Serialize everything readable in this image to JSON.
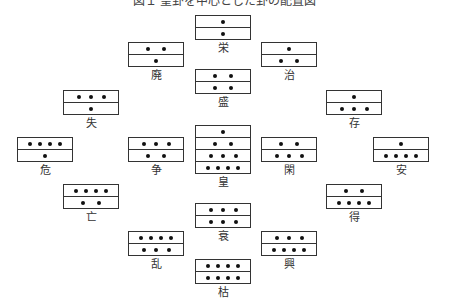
{
  "title": "図１ 皇卦を中心とした卦の配置図",
  "nodes": [
    {
      "label": "栄",
      "x": 195,
      "y": 15,
      "rows": [
        1,
        1
      ]
    },
    {
      "label": "廃",
      "x": 128,
      "y": 42,
      "rows": [
        2,
        1
      ]
    },
    {
      "label": "治",
      "x": 261,
      "y": 42,
      "rows": [
        1,
        2
      ]
    },
    {
      "label": "盛",
      "x": 195,
      "y": 69,
      "rows": [
        2,
        2
      ]
    },
    {
      "label": "失",
      "x": 63,
      "y": 90,
      "rows": [
        3,
        1
      ]
    },
    {
      "label": "存",
      "x": 326,
      "y": 90,
      "rows": [
        1,
        3
      ]
    },
    {
      "label": "危",
      "x": 17,
      "y": 137,
      "rows": [
        4,
        1
      ]
    },
    {
      "label": "争",
      "x": 128,
      "y": 137,
      "rows": [
        3,
        2
      ]
    },
    {
      "label": "皇",
      "x": 195,
      "y": 125,
      "rows": [
        1,
        2,
        3,
        4
      ]
    },
    {
      "label": "閑",
      "x": 261,
      "y": 137,
      "rows": [
        2,
        3
      ]
    },
    {
      "label": "安",
      "x": 373,
      "y": 137,
      "rows": [
        1,
        4
      ]
    },
    {
      "label": "亡",
      "x": 63,
      "y": 184,
      "rows": [
        4,
        2
      ]
    },
    {
      "label": "得",
      "x": 326,
      "y": 184,
      "rows": [
        2,
        4
      ]
    },
    {
      "label": "衰",
      "x": 195,
      "y": 203,
      "rows": [
        3,
        3
      ]
    },
    {
      "label": "乱",
      "x": 128,
      "y": 231,
      "rows": [
        4,
        3
      ]
    },
    {
      "label": "興",
      "x": 261,
      "y": 231,
      "rows": [
        3,
        4
      ]
    },
    {
      "label": "枯",
      "x": 195,
      "y": 259,
      "rows": [
        4,
        4
      ]
    }
  ]
}
